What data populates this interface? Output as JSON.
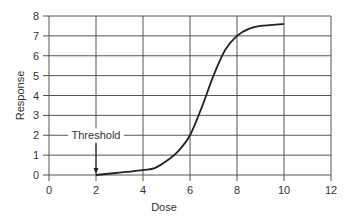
{
  "chart_data": {
    "type": "line",
    "title": "",
    "xlabel": "Dose",
    "ylabel": "Response",
    "xlim": [
      0,
      12
    ],
    "ylim": [
      0,
      8
    ],
    "x_ticks": [
      0,
      2,
      4,
      6,
      8,
      10,
      12
    ],
    "y_ticks": [
      0,
      1,
      2,
      3,
      4,
      5,
      6,
      7,
      8
    ],
    "grid": true,
    "legend": null,
    "series": [
      {
        "name": "Dose-response curve",
        "x": [
          2.0,
          3.0,
          4.0,
          4.5,
          5.0,
          5.5,
          6.0,
          6.5,
          7.0,
          7.5,
          8.0,
          8.5,
          9.0,
          10.0
        ],
        "y": [
          0.0,
          0.12,
          0.25,
          0.35,
          0.7,
          1.2,
          2.0,
          3.4,
          5.0,
          6.3,
          7.0,
          7.35,
          7.5,
          7.6
        ]
      }
    ],
    "annotations": [
      {
        "text": "Threshold",
        "x": 2,
        "y": 0,
        "label_position": {
          "x": 2,
          "y": 2
        },
        "arrow": true
      }
    ]
  },
  "colors": {
    "grid": "#555555",
    "curve": "#222222",
    "text": "#333333",
    "background": "#ffffff"
  }
}
